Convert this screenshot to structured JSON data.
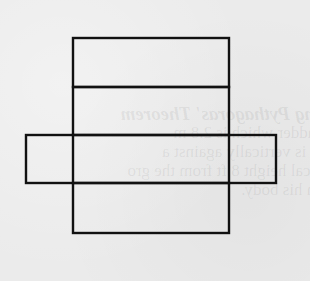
{
  "diagram": {
    "type": "cuboid-net",
    "stroke_color": "#111111",
    "background_color": "#ebebeb",
    "faces": [
      {
        "id": "top-flap",
        "x": 73,
        "y": 38,
        "w": 156,
        "h": 49
      },
      {
        "id": "upper-face",
        "x": 73,
        "y": 87,
        "w": 156,
        "h": 48
      },
      {
        "id": "center-face",
        "x": 73,
        "y": 135,
        "w": 156,
        "h": 48
      },
      {
        "id": "left-flap",
        "x": 26,
        "y": 135,
        "w": 47,
        "h": 48
      },
      {
        "id": "right-flap",
        "x": 229,
        "y": 135,
        "w": 47,
        "h": 48
      },
      {
        "id": "bottom-face",
        "x": 73,
        "y": 183,
        "w": 156,
        "h": 50
      }
    ]
  },
  "bleed_through_text": {
    "line1": "ing Pythagoras' Theorem",
    "line2": "ladder which is 2.8 m",
    "line3": "it is vertically against a",
    "line4": "tical height 8 ft from the gro",
    "line5": "m his body."
  }
}
